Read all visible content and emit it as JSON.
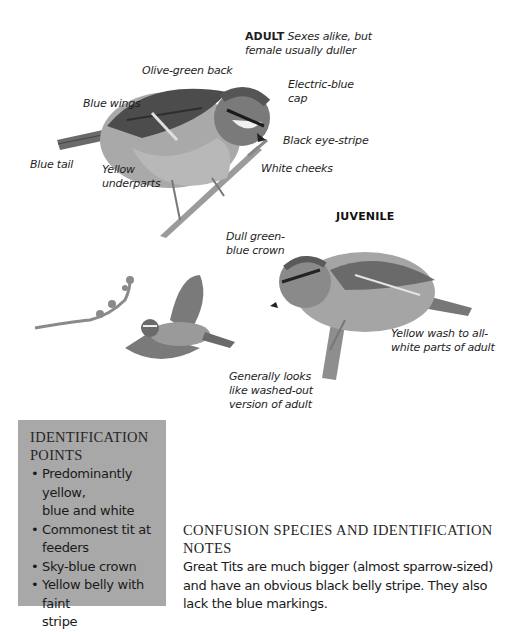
{
  "adult": {
    "tag": "ADULT",
    "note_line1": "Sexes alike, but",
    "note_line2": "female usually duller",
    "labels": {
      "olive_back": "Olive-green back",
      "blue_wings": "Blue wings",
      "electric_cap_line1": "Electric-blue",
      "electric_cap_line2": "cap",
      "black_eye_stripe": "Black eye-stripe",
      "blue_tail": "Blue tail",
      "yellow_underparts_line1": "Yellow",
      "yellow_underparts_line2": "underparts",
      "white_cheeks": "White cheeks"
    }
  },
  "juvenile": {
    "tag": "JUVENILE",
    "labels": {
      "crown_line1": "Dull green-",
      "crown_line2": "blue crown",
      "yellow_wash_line1": "Yellow wash to all-",
      "yellow_wash_line2": "white parts of adult",
      "general_line1": "Generally looks",
      "general_line2": "like washed-out",
      "general_line3": "version of adult"
    }
  },
  "identification_points": {
    "title_line1": "Identification",
    "title_line2": "Points",
    "bullet": "•",
    "items": [
      {
        "line1": "Predominantly yellow,",
        "line2": "blue and white"
      },
      {
        "line1": "Commonest tit at",
        "line2": "feeders"
      },
      {
        "line1": "Sky-blue crown",
        "line2": ""
      },
      {
        "line1": "Yellow belly with faint",
        "line2": "stripe"
      }
    ]
  },
  "confusion": {
    "title_line1": "Confusion species and identification",
    "title_line2": "notes",
    "body_line1": "Great Tits are much bigger (almost sparrow-sized)",
    "body_line2": "and have an obvious black belly stripe. They also",
    "body_line3": "lack the blue markings."
  },
  "colors": {
    "box_grey": "#a8a8a8",
    "text": "#1a1a1a"
  }
}
